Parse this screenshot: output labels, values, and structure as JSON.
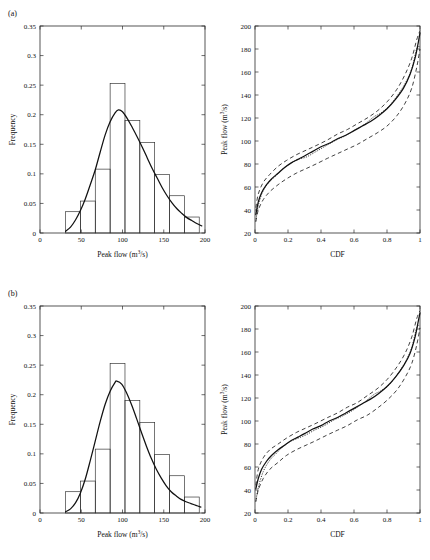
{
  "figure": {
    "panel_a_label": "(a)",
    "panel_b_label": "(b)"
  },
  "chart_data": [
    {
      "id": "panel-a-histogram",
      "type": "bar",
      "title": "",
      "panel": "(a)",
      "xlabel": "Peak flow (m3/s)",
      "xlabel_base": "Peak flow (m",
      "xlabel_sup": "3",
      "xlabel_tail": "/s)",
      "ylabel": "Frequency",
      "xlim": [
        0,
        200
      ],
      "ylim": [
        0,
        0.35
      ],
      "xticks": [
        0,
        50,
        100,
        150,
        200
      ],
      "xticklabels": [
        "0",
        "50",
        "100",
        "150",
        "200"
      ],
      "yticks": [
        0,
        0.05,
        0.1,
        0.15,
        0.2,
        0.25,
        0.3,
        0.35
      ],
      "yticklabels": [
        "0",
        "0.05",
        "0.1",
        "0.15",
        "0.2",
        "0.25",
        "0.3",
        "0.35"
      ],
      "grid": false,
      "legend": "none",
      "bin_edges": [
        31,
        49,
        67,
        85,
        103,
        121,
        139,
        157,
        175,
        193
      ],
      "bin_centers": [
        40,
        58,
        76,
        94,
        112,
        130,
        148,
        166,
        184
      ],
      "values": [
        0.036,
        0.054,
        0.108,
        0.253,
        0.19,
        0.153,
        0.099,
        0.063,
        0.027
      ],
      "series": [
        {
          "name": "Fitted probability density",
          "style": "solid-line",
          "peak_x": 95,
          "peak_y": 0.208,
          "x": [
            31,
            37,
            43,
            49,
            55,
            61,
            67,
            73,
            79,
            85,
            91,
            95,
            100,
            106,
            112,
            118,
            124,
            130,
            136,
            142,
            148,
            154,
            160,
            166,
            172,
            178,
            184,
            190,
            196
          ],
          "y": [
            0.003,
            0.01,
            0.022,
            0.038,
            0.058,
            0.082,
            0.107,
            0.137,
            0.166,
            0.188,
            0.203,
            0.208,
            0.205,
            0.193,
            0.178,
            0.162,
            0.145,
            0.127,
            0.109,
            0.093,
            0.077,
            0.063,
            0.051,
            0.041,
            0.033,
            0.026,
            0.021,
            0.016,
            0.012
          ]
        }
      ]
    },
    {
      "id": "panel-a-cdf",
      "type": "line",
      "title": "",
      "panel": "(a)",
      "xlabel": "CDF",
      "ylabel": "Peak flow (m3/s)",
      "ylabel_base": "Peak flow (m",
      "ylabel_sup": "3",
      "ylabel_tail": "/s)",
      "xlim": [
        0,
        1
      ],
      "ylim": [
        20,
        200
      ],
      "xticks": [
        0,
        0.2,
        0.4,
        0.6,
        0.8,
        1
      ],
      "xticklabels": [
        "0",
        "0.2",
        "0.4",
        "0.6",
        "0.8",
        "1"
      ],
      "yticks": [
        20,
        40,
        60,
        80,
        100,
        120,
        140,
        160,
        180,
        200
      ],
      "yticklabels": [
        "20",
        "40",
        "60",
        "80",
        "100",
        "120",
        "140",
        "160",
        "180",
        "200"
      ],
      "grid": false,
      "legend": "none",
      "series": [
        {
          "name": "Fitted quantile curve",
          "style": "solid-line",
          "x": [
            0.005,
            0.02,
            0.04,
            0.07,
            0.1,
            0.14,
            0.18,
            0.22,
            0.26,
            0.3,
            0.35,
            0.4,
            0.45,
            0.5,
            0.55,
            0.6,
            0.65,
            0.7,
            0.75,
            0.8,
            0.85,
            0.9,
            0.94,
            0.97,
            0.99,
            1.0
          ],
          "y": [
            36,
            47,
            55,
            62,
            67,
            72,
            77,
            81,
            84,
            87,
            91,
            95,
            98,
            102,
            105,
            109,
            113,
            117,
            122,
            128,
            136,
            146,
            158,
            172,
            186,
            194
          ]
        },
        {
          "name": "Empirical data",
          "style": "dotted-line",
          "x": [
            0.005,
            0.02,
            0.05,
            0.09,
            0.13,
            0.17,
            0.21,
            0.26,
            0.31,
            0.36,
            0.42,
            0.48,
            0.54,
            0.6,
            0.66,
            0.72,
            0.76,
            0.81,
            0.86,
            0.91,
            0.95,
            0.98,
            1.0
          ],
          "y": [
            30,
            44,
            57,
            65,
            70,
            76,
            80,
            84,
            86,
            90,
            95,
            100,
            104,
            109,
            114,
            121,
            124,
            130,
            139,
            150,
            163,
            180,
            182
          ]
        },
        {
          "name": "Upper confidence bound",
          "style": "dashed-line",
          "x": [
            0.005,
            0.02,
            0.05,
            0.09,
            0.14,
            0.19,
            0.25,
            0.31,
            0.37,
            0.44,
            0.5,
            0.56,
            0.62,
            0.68,
            0.74,
            0.8,
            0.86,
            0.91,
            0.95,
            0.98,
            1.0
          ],
          "y": [
            42,
            54,
            64,
            71,
            78,
            83,
            88,
            92,
            96,
            101,
            106,
            110,
            115,
            120,
            126,
            134,
            145,
            158,
            172,
            188,
            196
          ]
        },
        {
          "name": "Lower confidence bound",
          "style": "dashed-line",
          "x": [
            0.005,
            0.02,
            0.05,
            0.09,
            0.14,
            0.19,
            0.25,
            0.31,
            0.37,
            0.44,
            0.5,
            0.56,
            0.62,
            0.68,
            0.74,
            0.8,
            0.86,
            0.91,
            0.95,
            0.98,
            1.0
          ],
          "y": [
            30,
            40,
            49,
            56,
            62,
            67,
            72,
            76,
            80,
            85,
            89,
            93,
            97,
            102,
            107,
            113,
            122,
            133,
            146,
            164,
            180
          ]
        }
      ]
    },
    {
      "id": "panel-b-histogram",
      "type": "bar",
      "title": "",
      "panel": "(b)",
      "xlabel": "Peak flow (m3/s)",
      "xlabel_base": "Peak flow (m",
      "xlabel_sup": "3",
      "xlabel_tail": "/s)",
      "ylabel": "Frequency",
      "xlim": [
        0,
        200
      ],
      "ylim": [
        0,
        0.35
      ],
      "xticks": [
        0,
        50,
        100,
        150,
        200
      ],
      "xticklabels": [
        "0",
        "50",
        "100",
        "150",
        "200"
      ],
      "yticks": [
        0,
        0.05,
        0.1,
        0.15,
        0.2,
        0.25,
        0.3,
        0.35
      ],
      "yticklabels": [
        "0",
        "0.05",
        "0.1",
        "0.15",
        "0.2",
        "0.25",
        "0.3",
        "0.35"
      ],
      "grid": false,
      "legend": "none",
      "bin_edges": [
        31,
        49,
        67,
        85,
        103,
        121,
        139,
        157,
        175,
        193
      ],
      "bin_centers": [
        40,
        58,
        76,
        94,
        112,
        130,
        148,
        166,
        184
      ],
      "values": [
        0.036,
        0.054,
        0.108,
        0.253,
        0.19,
        0.153,
        0.099,
        0.063,
        0.027
      ],
      "series": [
        {
          "name": "Fitted probability density",
          "style": "solid-line",
          "peak_x": 93,
          "peak_y": 0.223,
          "x": [
            31,
            37,
            43,
            49,
            55,
            61,
            67,
            73,
            79,
            85,
            91,
            93,
            99,
            105,
            111,
            117,
            123,
            129,
            135,
            141,
            147,
            153,
            159,
            165,
            171,
            177,
            183,
            189,
            195
          ],
          "y": [
            0.002,
            0.007,
            0.017,
            0.034,
            0.058,
            0.089,
            0.122,
            0.155,
            0.184,
            0.206,
            0.221,
            0.223,
            0.218,
            0.203,
            0.183,
            0.16,
            0.136,
            0.113,
            0.092,
            0.074,
            0.059,
            0.046,
            0.036,
            0.029,
            0.023,
            0.019,
            0.016,
            0.013,
            0.01
          ]
        }
      ]
    },
    {
      "id": "panel-b-cdf",
      "type": "line",
      "title": "",
      "panel": "(b)",
      "xlabel": "CDF",
      "ylabel": "Peak flow (m3/s)",
      "ylabel_base": "Peak flow (m",
      "ylabel_sup": "3",
      "ylabel_tail": "/s)",
      "xlim": [
        0,
        1
      ],
      "ylim": [
        20,
        200
      ],
      "xticks": [
        0,
        0.2,
        0.4,
        0.6,
        0.8,
        1
      ],
      "xticklabels": [
        "0",
        "0.2",
        "0.4",
        "0.6",
        "0.8",
        "1"
      ],
      "yticks": [
        20,
        40,
        60,
        80,
        100,
        120,
        140,
        160,
        180,
        200
      ],
      "yticklabels": [
        "20",
        "40",
        "60",
        "80",
        "100",
        "120",
        "140",
        "160",
        "180",
        "200"
      ],
      "grid": false,
      "legend": "none",
      "series": [
        {
          "name": "Fitted quantile curve",
          "style": "solid-line",
          "x": [
            0.005,
            0.02,
            0.04,
            0.07,
            0.1,
            0.14,
            0.18,
            0.22,
            0.26,
            0.3,
            0.35,
            0.4,
            0.45,
            0.5,
            0.55,
            0.6,
            0.65,
            0.7,
            0.75,
            0.8,
            0.85,
            0.9,
            0.94,
            0.97,
            0.99,
            1.0
          ],
          "y": [
            41,
            50,
            58,
            65,
            70,
            75,
            79,
            83,
            86,
            89,
            93,
            96,
            100,
            103,
            107,
            111,
            115,
            119,
            124,
            130,
            138,
            148,
            159,
            173,
            187,
            194
          ]
        },
        {
          "name": "Empirical data",
          "style": "dotted-line",
          "x": [
            0.005,
            0.02,
            0.05,
            0.09,
            0.13,
            0.17,
            0.21,
            0.26,
            0.31,
            0.36,
            0.42,
            0.48,
            0.54,
            0.6,
            0.66,
            0.72,
            0.76,
            0.81,
            0.86,
            0.91,
            0.95,
            0.98,
            1.0
          ],
          "y": [
            30,
            42,
            56,
            66,
            72,
            78,
            82,
            85,
            88,
            92,
            96,
            101,
            105,
            110,
            116,
            123,
            126,
            131,
            140,
            151,
            164,
            181,
            183
          ]
        },
        {
          "name": "Upper confidence bound",
          "style": "dashed-line",
          "x": [
            0.005,
            0.02,
            0.05,
            0.09,
            0.14,
            0.19,
            0.25,
            0.31,
            0.37,
            0.44,
            0.5,
            0.56,
            0.62,
            0.68,
            0.74,
            0.8,
            0.86,
            0.91,
            0.95,
            0.98,
            1.0
          ],
          "y": [
            44,
            58,
            68,
            75,
            80,
            85,
            90,
            94,
            98,
            103,
            107,
            112,
            116,
            122,
            128,
            136,
            147,
            159,
            173,
            189,
            196
          ]
        },
        {
          "name": "Lower confidence bound",
          "style": "dashed-line",
          "x": [
            0.005,
            0.02,
            0.05,
            0.09,
            0.14,
            0.19,
            0.25,
            0.31,
            0.37,
            0.44,
            0.5,
            0.56,
            0.62,
            0.68,
            0.74,
            0.8,
            0.86,
            0.91,
            0.95,
            0.98,
            1.0
          ],
          "y": [
            30,
            40,
            50,
            58,
            64,
            70,
            75,
            79,
            83,
            88,
            92,
            96,
            101,
            105,
            111,
            118,
            127,
            138,
            150,
            166,
            181
          ]
        }
      ]
    }
  ]
}
